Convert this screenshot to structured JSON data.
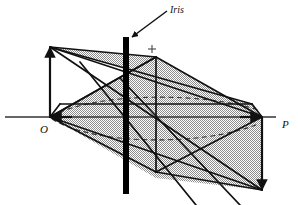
{
  "figure": {
    "type": "line-diagram",
    "canvas": {
      "width": 298,
      "height": 205,
      "background": "#ffffff"
    },
    "colors": {
      "ink": "#111111",
      "iris_bar": "#000000",
      "stipple_fill": "#b9b9b9",
      "dashed": "#3a3a3a",
      "axis": "#333333"
    },
    "labels": {
      "iris": "Iris",
      "origin": "O",
      "point_p": "P"
    },
    "markers": {
      "cross": "+"
    },
    "points": {
      "O": {
        "x": 50,
        "y": 117
      },
      "P": {
        "x": 262,
        "y": 117
      },
      "top_left_apex": {
        "x": 50,
        "y": 47
      },
      "top_mid_apex": {
        "x": 156,
        "y": 57
      },
      "bottom_mid_vertex": {
        "x": 156,
        "y": 172
      },
      "bottom_right_vertex": {
        "x": 262,
        "y": 190
      },
      "left_near": {
        "x": 60,
        "y": 104
      },
      "right_near": {
        "x": 252,
        "y": 104
      },
      "cross_marker": {
        "x": 152,
        "y": 49
      }
    },
    "iris_bar": {
      "x": 123,
      "y": 37,
      "width": 6,
      "height": 157
    },
    "iris_arrow": {
      "from_x": 168,
      "from_y": 10,
      "to_x": 131,
      "to_y": 38
    },
    "axis_line": {
      "x1": 5,
      "y1": 117,
      "x2": 276,
      "y2": 117
    },
    "arrows": [
      {
        "name": "o-up-arrow",
        "from_x": 50,
        "from_y": 116,
        "to_x": 50,
        "to_y": 45
      },
      {
        "name": "p-down-arrow",
        "from_x": 262,
        "from_y": 118,
        "to_x": 262,
        "to_y": 192
      }
    ]
  }
}
